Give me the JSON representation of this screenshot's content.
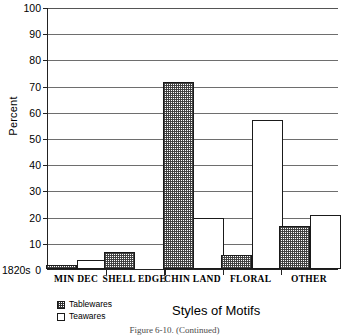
{
  "chart_data": {
    "type": "bar",
    "title": "",
    "xlabel": "Styles of Motifs",
    "ylabel": "Percent",
    "ylim": [
      0,
      100
    ],
    "ytick_step": 10,
    "grid": true,
    "legend_position": "bottom-left",
    "categories": [
      "MIN DEC",
      "SHELL EDGE",
      "CHIN LAND",
      "FLORAL",
      "OTHER"
    ],
    "series": [
      {
        "name": "Tablewares",
        "values": [
          1.5,
          6.5,
          71.5,
          5.5,
          16.5
        ]
      },
      {
        "name": "Teawares",
        "values": [
          3.5,
          0,
          19.5,
          57,
          20.5
        ]
      }
    ],
    "yticks": [
      "100",
      "90",
      "80",
      "70",
      "60",
      "50",
      "40",
      "30",
      "20",
      "10",
      "0"
    ],
    "annotations": {
      "origin_label": "1820s"
    }
  },
  "axis": {
    "ylabel": "Percent",
    "xlabel": "Styles of Motifs",
    "origin_label": "1820s"
  },
  "legend": {
    "items": [
      {
        "label": "Tablewares",
        "pattern": "hatched"
      },
      {
        "label": "Teawares",
        "pattern": "white"
      }
    ]
  },
  "caption": {
    "text": "Figure 6-10. (Continued)"
  }
}
